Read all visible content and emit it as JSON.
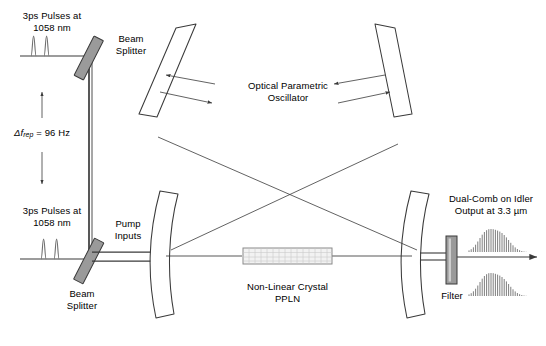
{
  "figure": {
    "background": "#ffffff",
    "line_color": "#3a3a3a",
    "element_fill": "#9a9a9a",
    "crystal_fill": "#f2f2f2"
  },
  "labels": {
    "top_source_line1": "3ps Pulses at",
    "top_source_line2": "1058 nm",
    "bottom_source_line1": "3ps Pulses at",
    "bottom_source_line2": "1058 nm",
    "beam_splitter_top_line1": "Beam",
    "beam_splitter_top_line2": "Splitter",
    "beam_splitter_bottom_line1": "Beam",
    "beam_splitter_bottom_line2": "Splitter",
    "rep_rate_delta": "Δf",
    "rep_rate_sub": "rep",
    "rep_rate_value": " = 96 Hz",
    "opo_line1": "Optical Parametric",
    "opo_line2": "Oscillator",
    "pump_inputs_line1": "Pump",
    "pump_inputs_line2": "Inputs",
    "crystal_line1": "Non-Linear Crystal",
    "crystal_line2": "PPLN",
    "output_line1": "Dual-Comb on Idler",
    "output_line2": "Output at 3.3 µm",
    "filter": "Filter"
  },
  "components": [
    {
      "name": "beam-splitter-top",
      "type": "beam-splitter",
      "fill": "#9a9a9a"
    },
    {
      "name": "beam-splitter-bottom",
      "type": "beam-splitter",
      "fill": "#9a9a9a"
    },
    {
      "name": "mirror-top-left",
      "type": "flat-mirror"
    },
    {
      "name": "mirror-top-right",
      "type": "flat-mirror"
    },
    {
      "name": "mirror-curved-left",
      "type": "curved-mirror"
    },
    {
      "name": "mirror-curved-right",
      "type": "curved-mirror"
    },
    {
      "name": "ppln-crystal",
      "type": "nonlinear-crystal",
      "fill": "#f2f2f2"
    },
    {
      "name": "output-filter",
      "type": "filter",
      "fill": "#9a9a9a"
    }
  ],
  "pulse_trains": {
    "top": {
      "peaks": 2
    },
    "bottom": {
      "peaks": 2
    }
  },
  "comb_spectra": {
    "upper": {
      "lines": 27,
      "envelope": "gaussian"
    },
    "lower": {
      "lines": 27,
      "envelope": "gaussian"
    }
  }
}
